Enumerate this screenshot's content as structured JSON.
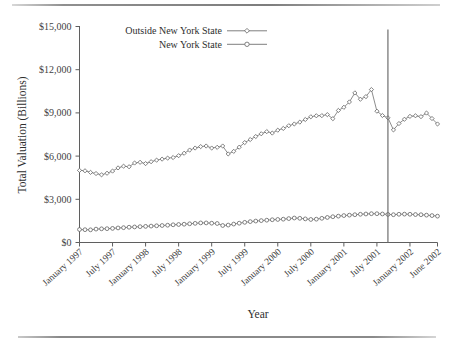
{
  "figure": {
    "xlabel": "Year",
    "ylabel": "Total Valuation (Billions)"
  },
  "legend": {
    "position": "top-left-inside",
    "entries": [
      {
        "label": "Outside New York State",
        "marker": "diamond-marker"
      },
      {
        "label": "New York State",
        "marker": "circle-marker"
      }
    ]
  },
  "annotations": [
    {
      "name": "september-2001-reference-line",
      "x_value": 56,
      "label": ""
    }
  ],
  "chart_data": {
    "type": "line",
    "title": "",
    "xlabel": "Year",
    "ylabel": "Total Valuation (Billions)",
    "ylim": [
      0,
      15000
    ],
    "yticks": [
      0,
      3000,
      6000,
      9000,
      12000,
      15000
    ],
    "ytick_labels": [
      "$0",
      "$3,000",
      "$6,000",
      "$9,000",
      "$12,000",
      "$15,000"
    ],
    "xtick_labels": [
      "January 1997",
      "July 1997",
      "January 1998",
      "July 1998",
      "January 1999",
      "July 1999",
      "January 2000",
      "July 2000",
      "January 2001",
      "July 2001",
      "January 2002",
      "June 2002"
    ],
    "xtick_indices": [
      0,
      6,
      12,
      18,
      24,
      30,
      36,
      42,
      48,
      54,
      60,
      65
    ],
    "x_count": 66,
    "grid": false,
    "legend_position": "upper left",
    "series": [
      {
        "name": "Outside New York State",
        "marker": "diamond",
        "values": [
          5010,
          4980,
          4870,
          4790,
          4700,
          4810,
          4960,
          5180,
          5300,
          5260,
          5520,
          5570,
          5480,
          5610,
          5720,
          5790,
          5860,
          5900,
          6030,
          6200,
          6420,
          6560,
          6660,
          6700,
          6560,
          6610,
          6700,
          6150,
          6330,
          6620,
          6940,
          7150,
          7360,
          7550,
          7700,
          7600,
          7800,
          7920,
          8110,
          8230,
          8360,
          8540,
          8730,
          8800,
          8810,
          8880,
          8600,
          9170,
          9390,
          9760,
          10390,
          9950,
          10130,
          10620,
          10700,
          10600,
          10690,
          10960,
          10690,
          10440,
          10100,
          9820,
          9960,
          9240,
          8740,
          9100
        ]
      },
      {
        "name": "New York State",
        "marker": "circle",
        "values": [
          900,
          890,
          880,
          930,
          950,
          960,
          980,
          1010,
          1030,
          1060,
          1080,
          1100,
          1120,
          1140,
          1160,
          1180,
          1200,
          1230,
          1250,
          1270,
          1300,
          1330,
          1360,
          1360,
          1340,
          1320,
          1180,
          1210,
          1280,
          1340,
          1400,
          1450,
          1490,
          1520,
          1550,
          1580,
          1600,
          1620,
          1660,
          1700,
          1680,
          1640,
          1600,
          1620,
          1680,
          1740,
          1790,
          1830,
          1870,
          1900,
          1930,
          1960,
          1980,
          2000,
          1980,
          1960,
          1940,
          1930,
          1950,
          1970,
          1990,
          1970,
          1930,
          1900,
          1870,
          1840
        ]
      }
    ],
    "series_tail": [
      {
        "name": "Outside New York State",
        "values": [
          9120,
          8820,
          8660,
          7820,
          8260,
          8560,
          8760,
          8800,
          8740,
          8990,
          8610,
          8230
        ]
      },
      {
        "name": "New York State",
        "values": [
          2000,
          1980,
          1950,
          1930,
          1960,
          1970,
          1960,
          1940,
          1930,
          1900,
          1870,
          1830
        ]
      }
    ]
  }
}
